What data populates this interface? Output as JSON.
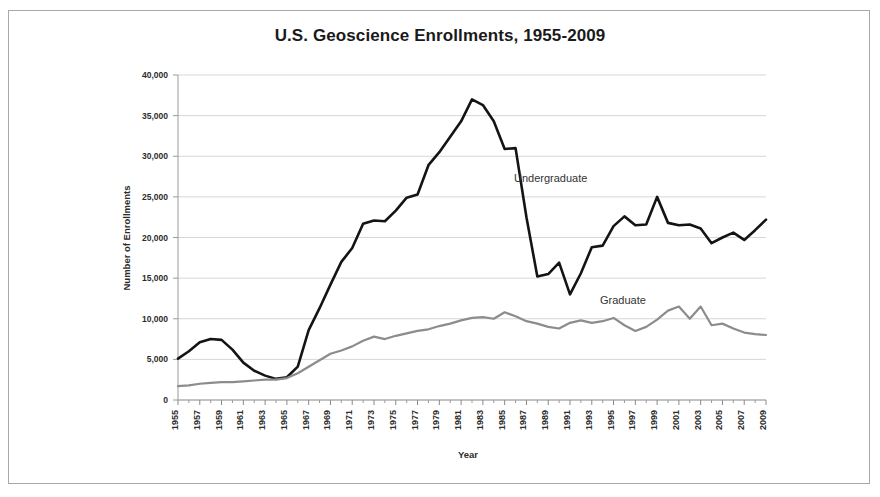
{
  "chart_data": {
    "type": "line",
    "title": "U.S. Geoscience Enrollments, 1955-2009",
    "xlabel": "Year",
    "ylabel": "Number of Enrollments",
    "ylim": [
      0,
      40000
    ],
    "xlim": [
      1955,
      2009
    ],
    "grid": true,
    "legend_position": "inline-annotation",
    "y_ticks": [
      0,
      5000,
      10000,
      15000,
      20000,
      25000,
      30000,
      35000,
      40000
    ],
    "y_tick_labels": [
      "0",
      "5,000",
      "10,000",
      "15,000",
      "20,000",
      "25,000",
      "30,000",
      "35,000",
      "40,000"
    ],
    "x_tick_labels": [
      "1955",
      "1957",
      "1959",
      "1961",
      "1963",
      "1965",
      "1967",
      "1969",
      "1971",
      "1973",
      "1975",
      "1977",
      "1979",
      "1981",
      "1983",
      "1985",
      "1987",
      "1989",
      "1991",
      "1993",
      "1995",
      "1997",
      "1999",
      "2001",
      "2003",
      "2005",
      "2007",
      "2009"
    ],
    "x": [
      1955,
      1956,
      1957,
      1958,
      1959,
      1960,
      1961,
      1962,
      1963,
      1964,
      1965,
      1966,
      1967,
      1968,
      1969,
      1970,
      1971,
      1972,
      1973,
      1974,
      1975,
      1976,
      1977,
      1978,
      1979,
      1980,
      1981,
      1982,
      1983,
      1984,
      1985,
      1986,
      1987,
      1988,
      1989,
      1990,
      1991,
      1992,
      1993,
      1994,
      1995,
      1996,
      1997,
      1998,
      1999,
      2000,
      2001,
      2002,
      2003,
      2004,
      2005,
      2006,
      2007,
      2008,
      2009
    ],
    "series": [
      {
        "name": "Undergraduate",
        "color": "#141414",
        "values": [
          5100,
          6000,
          7100,
          7500,
          7400,
          6200,
          4600,
          3600,
          3000,
          2600,
          2800,
          4100,
          8600,
          11300,
          14200,
          17000,
          18700,
          21700,
          22100,
          22000,
          23300,
          24900,
          25300,
          28900,
          30500,
          32400,
          34300,
          37000,
          36300,
          34300,
          30900,
          31000,
          22500,
          15200,
          15500,
          16900,
          13000,
          15600,
          18800,
          19000,
          21400,
          22600,
          21500,
          21600,
          25000,
          21800,
          21500,
          21600,
          21100,
          19300,
          20000,
          20600,
          19700,
          20900,
          22200
        ]
      },
      {
        "name": "Graduate",
        "color": "#8c8c8c",
        "values": [
          1700,
          1800,
          2000,
          2100,
          2200,
          2200,
          2300,
          2400,
          2500,
          2500,
          2700,
          3300,
          4100,
          4900,
          5700,
          6100,
          6600,
          7300,
          7800,
          7500,
          7900,
          8200,
          8500,
          8700,
          9100,
          9400,
          9800,
          10100,
          10200,
          10000,
          10800,
          10300,
          9700,
          9400,
          9000,
          8800,
          9500,
          9800,
          9500,
          9700,
          10100,
          9200,
          8500,
          9000,
          9900,
          11000,
          11500,
          10000,
          11500,
          9200,
          9400,
          8800,
          8300,
          8100,
          8000
        ]
      }
    ],
    "annotations": [
      {
        "text": "Undergraduate",
        "x_px": 514,
        "y_px": 182
      },
      {
        "text": "Graduate",
        "x_px": 600,
        "y_px": 304
      }
    ]
  },
  "plot_geometry": {
    "left": 178,
    "right": 766,
    "top": 75,
    "bottom": 400
  }
}
